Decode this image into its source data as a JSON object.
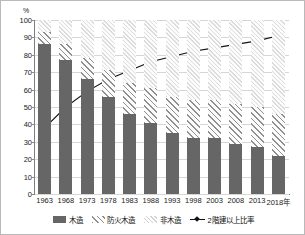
{
  "chart_data": {
    "type": "bar",
    "title": "",
    "xlabel": "",
    "ylabel": "%",
    "axis_unit": "%",
    "x_axis_suffix": "年",
    "ylim": [
      0,
      100
    ],
    "ytick_step": 10,
    "yticks": [
      0,
      10,
      20,
      30,
      40,
      50,
      60,
      70,
      80,
      90,
      100
    ],
    "ytick_labels": [
      "0",
      "10",
      "20",
      "30",
      "40",
      "50",
      "60",
      "70",
      "80",
      "90",
      "100"
    ],
    "grid": true,
    "legend_position": "bottom",
    "stacked": true,
    "categories": [
      "1963",
      "1968",
      "1973",
      "1978",
      "1983",
      "1988",
      "1993",
      "1998",
      "2003",
      "2008",
      "2013",
      "2018"
    ],
    "series": [
      {
        "name": "木造",
        "type": "bar",
        "fill": "solid",
        "color": "#666666",
        "values": [
          86,
          77,
          66,
          56,
          46,
          41,
          35,
          32,
          32,
          29,
          27,
          22
        ]
      },
      {
        "name": "防火木造",
        "type": "bar",
        "fill": "diagonal-hatch",
        "color": "#8f8f8f",
        "values": [
          7,
          9,
          12,
          15,
          18,
          20,
          21,
          22,
          22,
          23,
          23,
          24
        ]
      },
      {
        "name": "非木造",
        "type": "bar",
        "fill": "light-hatch",
        "color": "#dcdcdc",
        "values": [
          7,
          14,
          22,
          29,
          36,
          39,
          44,
          46,
          46,
          48,
          50,
          54
        ]
      },
      {
        "name": "2階建以上比率",
        "type": "line",
        "color": "#111111",
        "marker": "diamond",
        "values": [
          38,
          50,
          59,
          66,
          71,
          76,
          79,
          82,
          84,
          86,
          88,
          91
        ]
      }
    ],
    "legend": [
      {
        "label": "木造",
        "swatch": "solid-dark"
      },
      {
        "label": "防火木造",
        "swatch": "diagonal-hatch"
      },
      {
        "label": "非木造",
        "swatch": "light-hatch"
      },
      {
        "label": "2階建以上比率",
        "swatch": "line-marker"
      }
    ],
    "colors": {
      "mokuzo": "#666666",
      "bouka_mokuzo": "#8f8f8f",
      "hi_mokuzo": "#dcdcdc",
      "line": "#111111",
      "grid": "#d6d6d6",
      "axis": "#7d7d7d",
      "border": "#b9b9b9"
    }
  }
}
